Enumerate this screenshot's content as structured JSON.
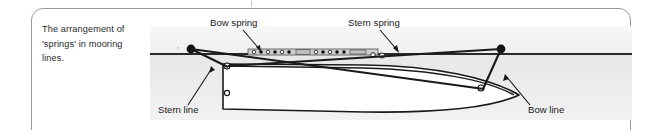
{
  "figure": {
    "caption": "The arrangement of 'springs' in mooring lines.",
    "caption_lines": [
      "The arrangement of",
      "'springs' in mooring",
      "lines."
    ],
    "labels": {
      "bow_spring": "Bow spring",
      "stern_spring": "Stern spring",
      "stern_line": "Stern line",
      "bow_line": "Bow line"
    },
    "colors": {
      "line": "#1a1a1a",
      "text": "#1a1a1a",
      "caption_text": "#2b2b2b",
      "panel_border": "#9a9a9a",
      "water": "#ebebeb",
      "quay": "#f4f4f4",
      "hull_fill": "#ffffff",
      "bollard": "#111111",
      "background": "#ffffff"
    },
    "diagram": {
      "type": "plan-view-mooring",
      "elements": [
        "quay-edge",
        "shore-bollard-left",
        "shore-bollard-right",
        "vessel-hull",
        "deck-fittings",
        "bow-spring-line",
        "stern-spring-line",
        "bow-line",
        "stern-line"
      ]
    }
  }
}
